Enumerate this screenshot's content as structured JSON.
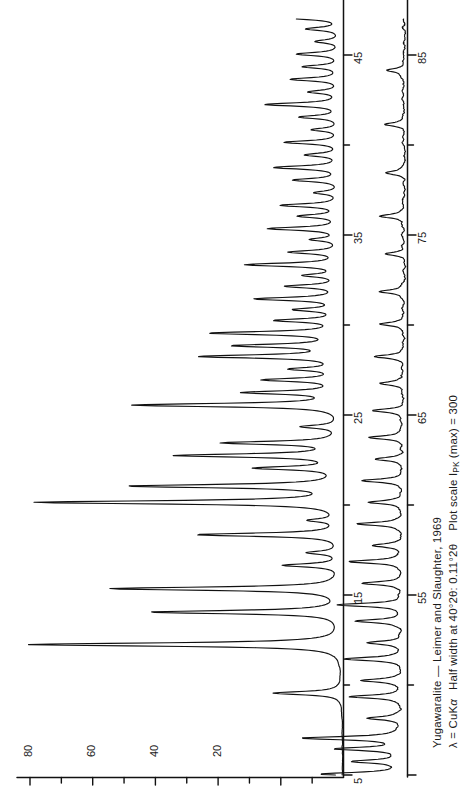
{
  "figure": {
    "kind": "xrd-powder-diffraction-pattern",
    "orientation": "rotated-90-ccw",
    "background": "#ffffff",
    "ink": "#111111"
  },
  "caption": {
    "line1_mineral": "Yugawaralite",
    "line1_dash": " — ",
    "line1_authors": "Leimer and Slaughter, 1969",
    "line2_lambda": "λ = CuK",
    "line2_lambda_alpha": "α",
    "line2_halfwidth": "Half width at 40°2θ: 0.11°2θ",
    "line2_scale_pre": "Plot scale I",
    "line2_scale_sub": "PK",
    "line2_scale_post": " (max) = 300"
  },
  "axes": {
    "intensity": {
      "label_unit": "relative intensity",
      "min": 0,
      "max": 100,
      "minor_tick_step": 10,
      "labeled_ticks": [
        20,
        40,
        60,
        80
      ],
      "all_ticks": [
        0,
        10,
        20,
        30,
        40,
        50,
        60,
        70,
        80,
        90,
        100
      ]
    },
    "two_theta_upper": {
      "label_unit": "degrees 2theta",
      "min": 5,
      "max": 47,
      "minor_tick_step": 5,
      "labeled_ticks": [
        5,
        15,
        25,
        35,
        45
      ]
    },
    "two_theta_lower": {
      "label_unit": "degrees 2theta",
      "min": 45,
      "max": 87,
      "minor_tick_step": 5,
      "labeled_ticks": [
        55,
        65,
        75,
        85
      ]
    }
  },
  "chart_data": {
    "type": "line",
    "title": "Yugawaralite — Leimer and Slaughter, 1969",
    "xlabel": "2θ (degrees, CuKα)",
    "ylabel": "Relative intensity",
    "xlim": [
      5,
      87
    ],
    "ylim": [
      0,
      100
    ],
    "grid": false,
    "legend": "none",
    "annotations": [
      "λ = CuKα",
      "Half width at 40°2θ: 0.11°2θ",
      "Plot scale I_PK (max) = 300"
    ],
    "peak_half_width_deg": 0.11,
    "peaks": [
      {
        "two_theta": 9.55,
        "intensity": 22
      },
      {
        "two_theta": 12.25,
        "intensity": 100
      },
      {
        "two_theta": 14.05,
        "intensity": 61
      },
      {
        "two_theta": 15.35,
        "intensity": 74
      },
      {
        "two_theta": 16.65,
        "intensity": 18
      },
      {
        "two_theta": 17.35,
        "intensity": 10
      },
      {
        "two_theta": 18.35,
        "intensity": 46
      },
      {
        "two_theta": 19.15,
        "intensity": 9
      },
      {
        "two_theta": 20.15,
        "intensity": 97
      },
      {
        "two_theta": 21.05,
        "intensity": 67
      },
      {
        "two_theta": 22.05,
        "intensity": 26
      },
      {
        "two_theta": 22.75,
        "intensity": 52
      },
      {
        "two_theta": 23.45,
        "intensity": 37
      },
      {
        "two_theta": 24.35,
        "intensity": 12
      },
      {
        "two_theta": 25.55,
        "intensity": 66
      },
      {
        "two_theta": 26.25,
        "intensity": 30
      },
      {
        "two_theta": 26.95,
        "intensity": 24
      },
      {
        "two_theta": 27.55,
        "intensity": 15
      },
      {
        "two_theta": 28.25,
        "intensity": 44
      },
      {
        "two_theta": 28.85,
        "intensity": 33
      },
      {
        "two_theta": 29.55,
        "intensity": 41
      },
      {
        "two_theta": 30.25,
        "intensity": 20
      },
      {
        "two_theta": 30.85,
        "intensity": 14
      },
      {
        "two_theta": 31.45,
        "intensity": 27
      },
      {
        "two_theta": 32.15,
        "intensity": 17
      },
      {
        "two_theta": 32.75,
        "intensity": 11
      },
      {
        "two_theta": 33.35,
        "intensity": 30
      },
      {
        "two_theta": 34.05,
        "intensity": 16
      },
      {
        "two_theta": 34.75,
        "intensity": 9
      },
      {
        "two_theta": 35.35,
        "intensity": 23
      },
      {
        "two_theta": 36.05,
        "intensity": 13
      },
      {
        "two_theta": 36.65,
        "intensity": 19
      },
      {
        "two_theta": 37.35,
        "intensity": 8
      },
      {
        "two_theta": 38.05,
        "intensity": 15
      },
      {
        "two_theta": 38.75,
        "intensity": 21
      },
      {
        "two_theta": 39.45,
        "intensity": 11
      },
      {
        "two_theta": 40.15,
        "intensity": 18
      },
      {
        "two_theta": 40.85,
        "intensity": 9
      },
      {
        "two_theta": 41.55,
        "intensity": 13
      },
      {
        "two_theta": 42.25,
        "intensity": 24
      },
      {
        "two_theta": 42.95,
        "intensity": 10
      },
      {
        "two_theta": 43.65,
        "intensity": 16
      },
      {
        "two_theta": 44.35,
        "intensity": 12
      },
      {
        "two_theta": 45.05,
        "intensity": 14
      },
      {
        "two_theta": 45.75,
        "intensity": 8
      },
      {
        "two_theta": 46.45,
        "intensity": 11
      },
      {
        "two_theta": 47.05,
        "intensity": 17
      },
      {
        "two_theta": 48.15,
        "intensity": 6
      },
      {
        "two_theta": 49.35,
        "intensity": 9
      },
      {
        "two_theta": 50.25,
        "intensity": 7
      },
      {
        "two_theta": 51.45,
        "intensity": 10
      },
      {
        "two_theta": 52.35,
        "intensity": 6
      },
      {
        "two_theta": 53.55,
        "intensity": 8
      },
      {
        "two_theta": 54.45,
        "intensity": 11
      },
      {
        "two_theta": 55.65,
        "intensity": 7
      },
      {
        "two_theta": 56.85,
        "intensity": 9
      },
      {
        "two_theta": 57.75,
        "intensity": 5
      },
      {
        "two_theta": 58.95,
        "intensity": 8
      },
      {
        "two_theta": 60.15,
        "intensity": 6
      },
      {
        "two_theta": 61.35,
        "intensity": 7
      },
      {
        "two_theta": 62.55,
        "intensity": 5
      },
      {
        "two_theta": 63.75,
        "intensity": 6
      },
      {
        "two_theta": 65.25,
        "intensity": 5
      },
      {
        "two_theta": 66.75,
        "intensity": 4
      },
      {
        "two_theta": 68.25,
        "intensity": 5
      },
      {
        "two_theta": 70.05,
        "intensity": 4
      },
      {
        "two_theta": 71.85,
        "intensity": 4
      },
      {
        "two_theta": 73.95,
        "intensity": 3
      },
      {
        "two_theta": 76.05,
        "intensity": 4
      },
      {
        "two_theta": 78.45,
        "intensity": 3
      },
      {
        "two_theta": 81.15,
        "intensity": 3
      },
      {
        "two_theta": 84.15,
        "intensity": 3
      }
    ]
  },
  "tick_labels": {
    "intensity": [
      "80",
      "60",
      "40",
      "20"
    ],
    "two_theta_upper": [
      "5",
      "15",
      "25",
      "35",
      "45"
    ],
    "two_theta_lower": [
      "55",
      "65",
      "75",
      "85"
    ]
  }
}
